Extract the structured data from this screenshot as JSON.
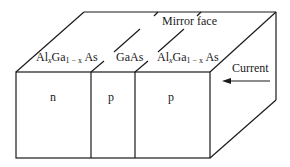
{
  "diagram": {
    "title": "Mirror face",
    "layers": [
      {
        "material": "AlxGa1-xAs",
        "material_main1": "Al",
        "sub1": "x",
        "main2": "Ga",
        "sub2": "1 − x",
        "main3": " As",
        "doping": "n"
      },
      {
        "material": "GaAs",
        "label": "GaAs",
        "doping": "p"
      },
      {
        "material": "AlxGa1-xAs",
        "main1": "Al",
        "sub1": "x",
        "main2": "Ga",
        "sub2": "1 − x",
        "main3": " As",
        "doping": "p"
      }
    ],
    "current_label": "Current",
    "current_arrow": "arrow-left",
    "line_color": "#1a1a1a"
  }
}
